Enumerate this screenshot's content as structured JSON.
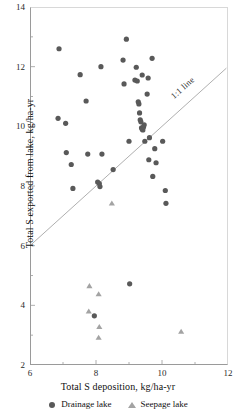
{
  "chart_data": {
    "type": "scatter",
    "title": "",
    "xlabel": "Total S deposition, kg/ha-yr",
    "ylabel": "Total S exported from lake, kg/ha-yr",
    "xlim": [
      6,
      12
    ],
    "ylim": [
      2,
      14
    ],
    "xticks": [
      6,
      8,
      10,
      12
    ],
    "xtick_labels": [
      "6",
      "8",
      "10",
      "12"
    ],
    "yticks": [
      2,
      4,
      6,
      8,
      10,
      12,
      14
    ],
    "ytick_labels": [
      "2",
      "4",
      "6",
      "8",
      "10",
      "12",
      "14"
    ],
    "x_minor_ticks": [
      7,
      9,
      11
    ],
    "y_minor_ticks": [
      3,
      5,
      7,
      9,
      11,
      13
    ],
    "grid": false,
    "legend_position": "below",
    "colors": {
      "drainage": "#595959",
      "seepage": "#a3a3a3",
      "reference_line": "#9a9a9a",
      "axis": "#9a9a9a",
      "text": "#111111"
    },
    "annotations": [
      {
        "name": "one-to-one-line-label",
        "text": "1:1 line",
        "x": 11.1,
        "y": 11.1,
        "rotation": -42
      }
    ],
    "reference_line": {
      "name": "1:1 line",
      "slope": 1,
      "intercept": 0,
      "x_start": 6.0,
      "y_start": 6.0,
      "x_end": 11.95,
      "y_end": 11.95,
      "color": "#9a9a9a",
      "width": 0.8
    },
    "series": [
      {
        "name": "Drainage lake",
        "marker": "circle",
        "color": "#595959",
        "size": 5.2,
        "points": [
          [
            6.88,
            12.6
          ],
          [
            6.85,
            10.27
          ],
          [
            7.08,
            10.1
          ],
          [
            7.1,
            9.12
          ],
          [
            7.25,
            8.72
          ],
          [
            7.3,
            7.92
          ],
          [
            7.52,
            11.73
          ],
          [
            7.7,
            10.85
          ],
          [
            7.75,
            9.07
          ],
          [
            8.05,
            8.13
          ],
          [
            8.1,
            8.08
          ],
          [
            8.12,
            7.98
          ],
          [
            8.15,
            12.0
          ],
          [
            8.18,
            9.07
          ],
          [
            8.52,
            8.55
          ],
          [
            8.82,
            12.22
          ],
          [
            8.85,
            11.42
          ],
          [
            8.92,
            12.92
          ],
          [
            9.0,
            9.5
          ],
          [
            9.02,
            4.72
          ],
          [
            9.18,
            11.55
          ],
          [
            9.22,
            11.98
          ],
          [
            9.25,
            11.52
          ],
          [
            9.28,
            10.82
          ],
          [
            9.3,
            10.75
          ],
          [
            9.32,
            10.45
          ],
          [
            9.34,
            10.22
          ],
          [
            9.36,
            10.15
          ],
          [
            9.38,
            9.95
          ],
          [
            9.4,
            9.9
          ],
          [
            9.42,
            9.88
          ],
          [
            9.44,
            9.98
          ],
          [
            9.46,
            10.05
          ],
          [
            9.48,
            9.5
          ],
          [
            9.4,
            11.72
          ],
          [
            9.55,
            11.08
          ],
          [
            9.58,
            11.62
          ],
          [
            9.62,
            9.62
          ],
          [
            9.6,
            8.88
          ],
          [
            9.7,
            12.28
          ],
          [
            9.72,
            8.32
          ],
          [
            9.78,
            9.25
          ],
          [
            9.82,
            8.78
          ],
          [
            10.02,
            9.5
          ],
          [
            10.1,
            7.85
          ],
          [
            10.12,
            7.42
          ],
          [
            7.95,
            3.65
          ]
        ]
      },
      {
        "name": "Seepage lake",
        "marker": "triangle",
        "color": "#a3a3a3",
        "size": 5.2,
        "points": [
          [
            8.48,
            7.42
          ],
          [
            7.8,
            4.65
          ],
          [
            8.08,
            4.38
          ],
          [
            7.78,
            3.8
          ],
          [
            8.1,
            3.28
          ],
          [
            8.08,
            2.92
          ],
          [
            10.58,
            3.12
          ]
        ]
      }
    ]
  },
  "legend": {
    "entries": [
      {
        "label": "Drainage lake",
        "marker": "circle"
      },
      {
        "label": "Seepage lake",
        "marker": "triangle"
      }
    ]
  }
}
